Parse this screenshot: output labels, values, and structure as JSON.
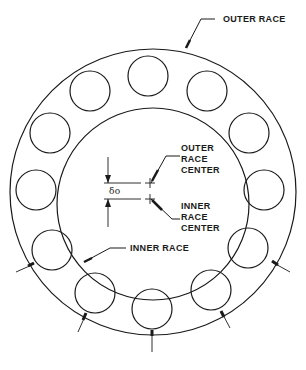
{
  "diagram": {
    "labels": {
      "outer_race": "OUTER RACE",
      "outer_race_center_1": "OUTER",
      "outer_race_center_2": "RACE",
      "outer_race_center_3": "CENTER",
      "inner_race_center_1": "INNER",
      "inner_race_center_2": "RACE",
      "inner_race_center_3": "CENTER",
      "inner_race": "INNER RACE",
      "delta": "δo"
    },
    "geometry": {
      "outer_race": {
        "cx": 153,
        "cy": 192,
        "r": 143
      },
      "inner_race": {
        "cx": 153,
        "cy": 204,
        "r": 96
      },
      "ball_radius": 20,
      "ball_count": 12
    },
    "colors": {
      "line": "#1a1a1a",
      "background": "#ffffff"
    }
  }
}
